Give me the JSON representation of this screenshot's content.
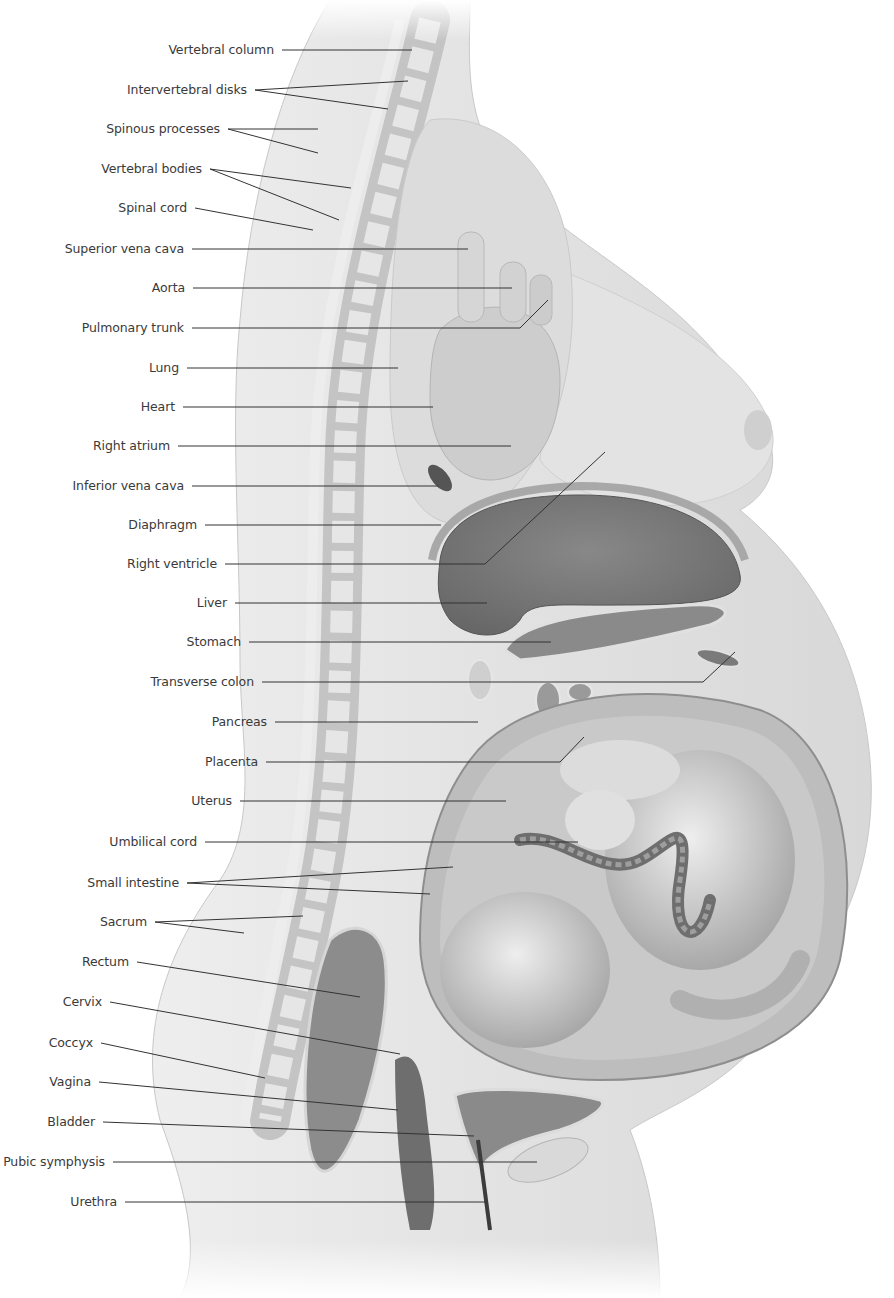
{
  "diagram": {
    "colors": {
      "background": "#ffffff",
      "skin": "#e6e6e6",
      "skin_dark": "#c9c9c9",
      "lung": "#d8d8d8",
      "heart": "#cfcfcf",
      "liver": "#7a7a7a",
      "uterus_wall": "#9a9a9a",
      "fetus": "#d4d4d4",
      "label_text": "#3a3a3a",
      "leader_line": "#333333"
    },
    "labels": [
      {
        "id": "vertebral-column",
        "text": "Vertebral column",
        "x": 282,
        "y": 50,
        "targets": [
          [
            412,
            50
          ]
        ]
      },
      {
        "id": "intervertebral-disks",
        "text": "Intervertebral disks",
        "x": 255,
        "y": 90,
        "targets": [
          [
            408,
            81
          ],
          [
            388,
            109
          ]
        ]
      },
      {
        "id": "spinous-processes",
        "text": "Spinous processes",
        "x": 228,
        "y": 129,
        "targets": [
          [
            318,
            129
          ],
          [
            318,
            153
          ]
        ]
      },
      {
        "id": "vertebral-bodies",
        "text": "Vertebral bodies",
        "x": 210,
        "y": 169,
        "targets": [
          [
            351,
            188
          ],
          [
            339,
            220
          ]
        ]
      },
      {
        "id": "spinal-cord",
        "text": "Spinal cord",
        "x": 195,
        "y": 208,
        "targets": [
          [
            313,
            230
          ]
        ]
      },
      {
        "id": "superior-vena-cava",
        "text": "Superior vena cava",
        "x": 192,
        "y": 249,
        "targets": [
          [
            468,
            249
          ]
        ]
      },
      {
        "id": "aorta",
        "text": "Aorta",
        "x": 193,
        "y": 288,
        "targets": [
          [
            512,
            288
          ]
        ]
      },
      {
        "id": "pulmonary-trunk",
        "text": "Pulmonary trunk",
        "x": 192,
        "y": 328,
        "targets": [
          [
            520,
            328
          ],
          [
            548,
            300
          ]
        ]
      },
      {
        "id": "lung",
        "text": "Lung",
        "x": 187,
        "y": 368,
        "targets": [
          [
            398,
            368
          ]
        ]
      },
      {
        "id": "heart",
        "text": "Heart",
        "x": 183,
        "y": 407,
        "targets": [
          [
            433,
            407
          ]
        ]
      },
      {
        "id": "right-atrium",
        "text": "Right atrium",
        "x": 178,
        "y": 446,
        "targets": [
          [
            511,
            446
          ]
        ]
      },
      {
        "id": "inferior-vena-cava",
        "text": "Inferior vena cava",
        "x": 192,
        "y": 486,
        "targets": [
          [
            438,
            486
          ]
        ]
      },
      {
        "id": "diaphragm",
        "text": "Diaphragm",
        "x": 205,
        "y": 525,
        "targets": [
          [
            441,
            525
          ]
        ]
      },
      {
        "id": "right-ventricle",
        "text": "Right ventricle",
        "x": 225,
        "y": 564,
        "targets": [
          [
            485,
            564
          ],
          [
            605,
            452
          ]
        ]
      },
      {
        "id": "liver",
        "text": "Liver",
        "x": 235,
        "y": 603,
        "targets": [
          [
            487,
            603
          ]
        ]
      },
      {
        "id": "stomach",
        "text": "Stomach",
        "x": 249,
        "y": 642,
        "targets": [
          [
            551,
            642
          ]
        ]
      },
      {
        "id": "transverse-colon",
        "text": "Transverse colon",
        "x": 262,
        "y": 682,
        "targets": [
          [
            703,
            682
          ],
          [
            735,
            652
          ]
        ]
      },
      {
        "id": "pancreas",
        "text": "Pancreas",
        "x": 275,
        "y": 722,
        "targets": [
          [
            478,
            722
          ]
        ]
      },
      {
        "id": "placenta",
        "text": "Placenta",
        "x": 266,
        "y": 762,
        "targets": [
          [
            560,
            762
          ],
          [
            584,
            737
          ]
        ]
      },
      {
        "id": "uterus",
        "text": "Uterus",
        "x": 240,
        "y": 801,
        "targets": [
          [
            506,
            801
          ]
        ]
      },
      {
        "id": "umbilical-cord",
        "text": "Umbilical cord",
        "x": 205,
        "y": 842,
        "targets": [
          [
            578,
            842
          ]
        ]
      },
      {
        "id": "small-intestine",
        "text": "Small intestine",
        "x": 187,
        "y": 883,
        "targets": [
          [
            453,
            867
          ],
          [
            430,
            894
          ]
        ]
      },
      {
        "id": "sacrum",
        "text": "Sacrum",
        "x": 155,
        "y": 922,
        "targets": [
          [
            303,
            916
          ],
          [
            244,
            933
          ]
        ]
      },
      {
        "id": "rectum",
        "text": "Rectum",
        "x": 137,
        "y": 962,
        "targets": [
          [
            360,
            997
          ]
        ]
      },
      {
        "id": "cervix",
        "text": "Cervix",
        "x": 110,
        "y": 1002,
        "targets": [
          [
            400,
            1054
          ]
        ]
      },
      {
        "id": "coccyx",
        "text": "Coccyx",
        "x": 101,
        "y": 1043,
        "targets": [
          [
            265,
            1078
          ]
        ]
      },
      {
        "id": "vagina",
        "text": "Vagina",
        "x": 99,
        "y": 1082,
        "targets": [
          [
            398,
            1110
          ]
        ]
      },
      {
        "id": "bladder",
        "text": "Bladder",
        "x": 103,
        "y": 1122,
        "targets": [
          [
            474,
            1136
          ]
        ]
      },
      {
        "id": "pubic-symphysis",
        "text": "Pubic symphysis",
        "x": 113,
        "y": 1162,
        "targets": [
          [
            537,
            1162
          ]
        ]
      },
      {
        "id": "urethra",
        "text": "Urethra",
        "x": 125,
        "y": 1202,
        "targets": [
          [
            487,
            1202
          ]
        ]
      }
    ]
  }
}
